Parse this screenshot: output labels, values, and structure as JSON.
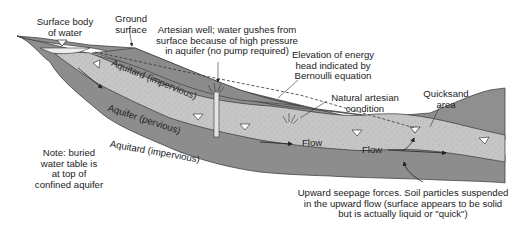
{
  "figure": {
    "type": "cross-section diagram"
  },
  "labels": {
    "surface_body_of_water": [
      "Surface body",
      "of water"
    ],
    "ground_surface": [
      "Ground",
      "surface"
    ],
    "artesian_well": [
      "Artesian well; water gushes from",
      "surface because of high pressure",
      "in aquifer (no pump required)"
    ],
    "energy_head": [
      "Elevation of energy",
      "head indicated by",
      "Bernoulli equation"
    ],
    "natural_artesian": [
      "Natural artesian",
      "condition"
    ],
    "quicksand": [
      "Quicksand",
      "area"
    ],
    "note": [
      "Note: buried",
      "water table is",
      "at top of",
      "confined aquifer"
    ],
    "upward_seepage": [
      "Upward seepage forces. Soil particles suspended",
      "in the upward flow (surface appears to be solid",
      "but is actually liquid or \"quick\")"
    ]
  },
  "layers": {
    "aquitard_upper": "Aquitard (impervious)",
    "aquifer": "Aquifer (pervious)",
    "aquitard_lower": "Aquitard (impervious)"
  },
  "flow_labels": [
    "Flow",
    "Flow"
  ],
  "colors": {
    "aquitard": "#8f8f8f",
    "aquitard_dark": "#7d7d7d",
    "aquifer": "#c4c4c4",
    "water": "#ececec",
    "outline": "#333333",
    "text": "#222222"
  }
}
